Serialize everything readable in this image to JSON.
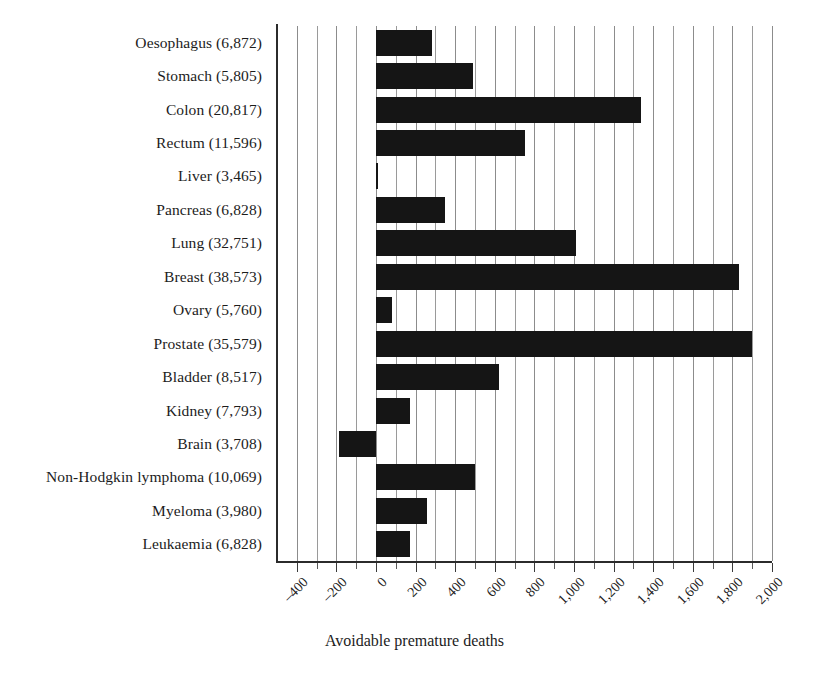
{
  "chart_data": {
    "type": "bar",
    "orientation": "horizontal",
    "title": "",
    "xlabel": "Avoidable premature deaths",
    "ylabel": "",
    "xlim": [
      -500,
      2000
    ],
    "xticks": [
      -400,
      -200,
      0,
      200,
      400,
      600,
      800,
      1000,
      1200,
      1400,
      1600,
      1800,
      2000
    ],
    "xtick_labels": [
      "–400",
      "–200",
      "0",
      "200",
      "400",
      "600",
      "800",
      "1,000",
      "1,200",
      "1,400",
      "1,600",
      "1,800",
      "2,000"
    ],
    "minor_tick_interval": 100,
    "grid": "vertical",
    "legend": "none",
    "bar_color": "#151515",
    "categories": [
      "Oesophagus (6,872)",
      "Stomach (5,805)",
      "Colon (20,817)",
      "Rectum (11,596)",
      "Liver (3,465)",
      "Pancreas (6,828)",
      "Lung (32,751)",
      "Breast (38,573)",
      "Ovary (5,760)",
      "Prostate (35,579)",
      "Bladder (8,517)",
      "Kidney (7,793)",
      "Brain (3,708)",
      "Non-Hodgkin lymphoma (10,069)",
      "Myeloma (3,980)",
      "Leukaemia (6,828)"
    ],
    "values": [
      285,
      490,
      1340,
      755,
      5,
      350,
      1010,
      1835,
      80,
      1900,
      620,
      170,
      -185,
      500,
      260,
      170
    ]
  }
}
